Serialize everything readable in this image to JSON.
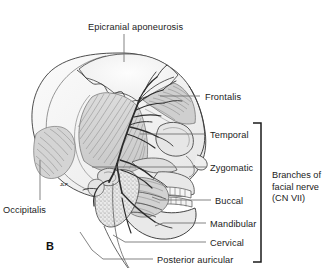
{
  "figure": {
    "panel_letter": "B",
    "background_color": "#ffffff",
    "ink_color": "#1b1b1b",
    "bone_fill": "#f2f2f2",
    "muscle_fill": "#d8d8d8",
    "nerve_color": "#2b2b2b",
    "leader_color": "#6e6e6e"
  },
  "labels": [
    {
      "id": "epicranial-aponeurosis",
      "text": "Epicranial aponeurosis",
      "x": 88,
      "y": 22,
      "align": "left"
    },
    {
      "id": "frontalis",
      "text": "Frontalis",
      "x": 205,
      "y": 92,
      "align": "left"
    },
    {
      "id": "temporal",
      "text": "Temporal",
      "x": 210,
      "y": 130,
      "align": "left"
    },
    {
      "id": "zygomatic",
      "text": "Zygomatic",
      "x": 210,
      "y": 163,
      "align": "left"
    },
    {
      "id": "buccal",
      "text": "Buccal",
      "x": 215,
      "y": 196,
      "align": "left"
    },
    {
      "id": "mandibular",
      "text": "Mandibular",
      "x": 210,
      "y": 219,
      "align": "left"
    },
    {
      "id": "cervical",
      "text": "Cervical",
      "x": 210,
      "y": 238,
      "align": "left"
    },
    {
      "id": "posterior-auricular",
      "text": "Posterior auricular",
      "x": 157,
      "y": 255,
      "align": "left"
    },
    {
      "id": "occipitalis",
      "text": "Occipitalis",
      "x": 3,
      "y": 205,
      "align": "left"
    }
  ],
  "bracket_group": {
    "id": "branches-of-facial-nerve",
    "lines": [
      "Branches of",
      "facial nerve",
      "(CN VII)"
    ],
    "x": 272,
    "y": 170,
    "bracket": {
      "x": 261,
      "top": 123,
      "bottom": 262,
      "arm": 8
    },
    "members": [
      "Temporal",
      "Zygomatic",
      "Buccal",
      "Mandibular",
      "Cervical",
      "Posterior auricular"
    ]
  },
  "leader_lines": [
    {
      "id": "leader-epicranial-aponeurosis",
      "x1": 124,
      "y1": 34,
      "x2": 124,
      "y2": 62
    },
    {
      "id": "leader-frontalis",
      "x1": 200,
      "y1": 96,
      "x2": 160,
      "y2": 96
    },
    {
      "id": "leader-temporal",
      "x1": 206,
      "y1": 134,
      "x2": 140,
      "y2": 134
    },
    {
      "id": "leader-zygomatic",
      "x1": 206,
      "y1": 167,
      "x2": 92,
      "y2": 167
    },
    {
      "id": "leader-buccal",
      "x1": 211,
      "y1": 200,
      "x2": 152,
      "y2": 197
    },
    {
      "id": "leader-mandibular",
      "x1": 206,
      "y1": 223,
      "x2": 155,
      "y2": 226
    },
    {
      "id": "leader-cervical",
      "x1": 206,
      "y1": 242,
      "x2": 113,
      "y2": 235
    },
    {
      "id": "leader-posterior-auricular",
      "x1": 153,
      "y1": 259,
      "x2": 103,
      "y2": 259
    },
    {
      "id": "leader-occipitalis",
      "x1": 40,
      "y1": 200,
      "x2": 40,
      "y2": 160
    }
  ],
  "anatomy_parts": [
    "cranial vault",
    "coronal suture",
    "epicranial aponeurosis (galea)",
    "temporalis muscle",
    "occipitalis muscle",
    "frontalis muscle",
    "orbit",
    "zygomatic arch",
    "parotid gland",
    "masseter muscle",
    "mandible",
    "maxillary and mandibular teeth",
    "external acoustic meatus",
    "facial nerve trunk and branches"
  ]
}
